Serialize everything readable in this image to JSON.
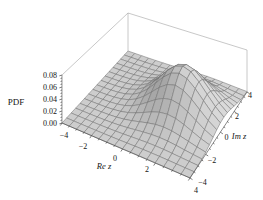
{
  "chart_data": {
    "type": "surface3d",
    "title": "",
    "xlabel": "Re z",
    "ylabel": "Im z",
    "zlabel": "PDF",
    "x_range": [
      -4,
      4
    ],
    "y_range": [
      -4,
      4
    ],
    "z_range": [
      0,
      0.08
    ],
    "x_tick_values": [
      -4,
      -2,
      0,
      2,
      4
    ],
    "x_tick_labels": [
      "−4",
      "−2",
      "0",
      "2",
      "4"
    ],
    "y_tick_values": [
      -4,
      -2,
      0,
      2,
      4
    ],
    "y_tick_labels": [
      "−4",
      "−2",
      "0",
      "2",
      "4"
    ],
    "z_tick_values": [
      0,
      0.02,
      0.04,
      0.06,
      0.08
    ],
    "z_tick_labels": [
      "0.00",
      "0.02",
      "0.04",
      "0.06",
      "0.08"
    ],
    "x_minor_tick_step": 0.5,
    "y_minor_tick_step": 0.5,
    "z_minor_tick_step": 0.005,
    "surface": {
      "formula": "pdf(x,y) = peak * exp(-((x-cx)^2 + (y-cy)^2)/(2*sigma^2))",
      "peak": 0.0796,
      "cx": 1.5,
      "cy": 0.5,
      "sigma": 1.4142
    },
    "mesh_cells": 16,
    "view": "perspective 3D box viewed from front-right above (Mathematica-style)",
    "colors": {
      "background": "#ffffff",
      "surface_base": "#cdcdcd",
      "mesh_line": "#6f6f6f",
      "box_edge": "#9b9b9b",
      "axis_line": "#4c4c4c",
      "text": "#141414"
    }
  }
}
